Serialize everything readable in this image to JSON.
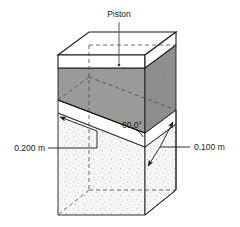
{
  "figure": {
    "title_label": "Piston",
    "angle_label": "60.0°",
    "left_dimension_label": "0.200 m",
    "right_dimension_label": "0.100 m",
    "colors": {
      "outline": "#1a1a1a",
      "wedge_fill": "#9a9a9a",
      "wedge_fill_dark": "#8d8d8d",
      "piston_fill": "#ffffff",
      "liquid_fill": "#f4f4f4",
      "stipple": "#b9b9b9",
      "hidden_line": "#555555",
      "background": "#ffffff"
    },
    "parts": {
      "piston": "piston",
      "wedge": "gas-wedge",
      "liquid": "liquid-body",
      "incline": "incline-surface"
    }
  }
}
